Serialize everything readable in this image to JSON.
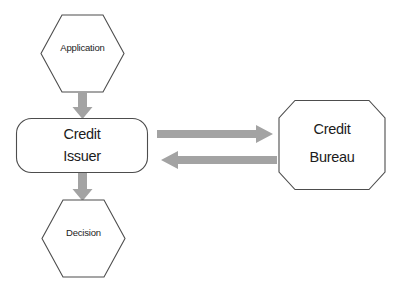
{
  "diagram": {
    "background_color": "#ffffff",
    "node_stroke_color": "#4d4d4d",
    "arrow_color": "#a3a3a3",
    "text_color": "#1c1c1c",
    "nodes": [
      {
        "id": "application",
        "label": "Application",
        "shape": "hexagon"
      },
      {
        "id": "credit-issuer",
        "label_line1": "Credit",
        "label_line2": "Issuer",
        "shape": "rounded-rectangle"
      },
      {
        "id": "credit-bureau",
        "label_line1": "Credit",
        "label_line2": "Bureau",
        "shape": "octagon"
      },
      {
        "id": "decision",
        "label": "Decision",
        "shape": "hexagon"
      }
    ],
    "arrows": [
      {
        "id": "application-to-issuer",
        "from": "application",
        "to": "credit-issuer",
        "direction": "down"
      },
      {
        "id": "issuer-to-bureau",
        "from": "credit-issuer",
        "to": "credit-bureau",
        "direction": "right"
      },
      {
        "id": "bureau-to-issuer",
        "from": "credit-bureau",
        "to": "credit-issuer",
        "direction": "left"
      },
      {
        "id": "issuer-to-decision",
        "from": "credit-issuer",
        "to": "decision",
        "direction": "down"
      }
    ]
  }
}
